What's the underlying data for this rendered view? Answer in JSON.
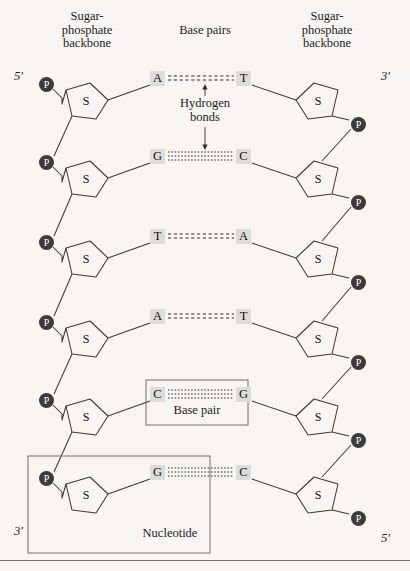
{
  "figure": {
    "background_color": "#f6f5f3",
    "headers": {
      "left": "Sugar-\nphosphate\nbackbone",
      "middle": "Base pairs",
      "right": "Sugar-\nphosphate\nbackbone"
    },
    "end_labels": {
      "top_left": "5′",
      "top_right": "3′",
      "bottom_left": "3′",
      "bottom_right": "5′"
    },
    "annotations": {
      "hydrogen_bonds": "Hydrogen\nbonds",
      "base_pair": "Base pair",
      "nucleotide": "Nucleotide"
    },
    "colors": {
      "phosphate_fill": "#3b3b3b",
      "phosphate_text": "#ffffff",
      "base_box_fill": "#dcdcda",
      "stroke": "#3a3a3a",
      "callout_border": "#6e6e6e",
      "text": "#1b1b1b"
    },
    "symbols": {
      "phosphate": "P",
      "sugar": "S"
    }
  },
  "chart_data": {
    "type": "diagram",
    "rows": [
      {
        "index": 0,
        "left_base": "A",
        "right_base": "T",
        "hydrogen_bonds": 2,
        "y": 78
      },
      {
        "index": 1,
        "left_base": "G",
        "right_base": "C",
        "hydrogen_bonds": 3,
        "y": 156
      },
      {
        "index": 2,
        "left_base": "T",
        "right_base": "A",
        "hydrogen_bonds": 2,
        "y": 236
      },
      {
        "index": 3,
        "left_base": "A",
        "right_base": "T",
        "hydrogen_bonds": 2,
        "y": 316
      },
      {
        "index": 4,
        "left_base": "C",
        "right_base": "G",
        "hydrogen_bonds": 3,
        "y": 394
      },
      {
        "index": 5,
        "left_base": "G",
        "right_base": "C",
        "hydrogen_bonds": 3,
        "y": 472
      }
    ],
    "left_strand": {
      "direction_top": "5′",
      "direction_bottom": "3′",
      "phosphate_count": 6,
      "sugar_count": 6,
      "bases": [
        "A",
        "G",
        "T",
        "A",
        "C",
        "G"
      ]
    },
    "right_strand": {
      "direction_top": "3′",
      "direction_bottom": "5′",
      "phosphate_count": 6,
      "sugar_count": 6,
      "bases": [
        "T",
        "C",
        "A",
        "T",
        "G",
        "C"
      ]
    },
    "callouts": [
      {
        "label": "Base pair",
        "encloses": "C-G pair row 5"
      },
      {
        "label": "Nucleotide",
        "encloses": "phosphate + sugar + G base, bottom-left"
      }
    ],
    "legend": [
      "Sugar-phosphate backbone",
      "Base pairs",
      "Hydrogen bonds"
    ]
  }
}
